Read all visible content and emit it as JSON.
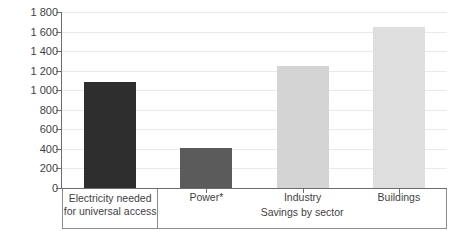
{
  "chart_data": {
    "type": "bar",
    "title": "",
    "xlabel": "Savings by sector",
    "ylabel": "TWh",
    "ylim": [
      0,
      1800
    ],
    "ytick_step": 200,
    "grid": true,
    "legend": "none",
    "categories": [
      "Electricity needed\nfor universal access",
      "Power*",
      "Industry",
      "Buildings"
    ],
    "values": [
      1080,
      410,
      1250,
      1650
    ],
    "ytick_labels": [
      "0",
      "200",
      "400",
      "600",
      "800",
      "1 000",
      "1 200",
      "1 400",
      "1 600",
      "1 800"
    ],
    "bar_colors": [
      "#2e2e2e",
      "#5b5b5b",
      "#d4d4d4",
      "#dedede"
    ],
    "groups": [
      {
        "label": "",
        "members": [
          "Electricity needed\nfor universal access"
        ]
      },
      {
        "label": "Savings by sector",
        "members": [
          "Power*",
          "Industry",
          "Buildings"
        ]
      }
    ],
    "footnote_marker": "*"
  },
  "axis": {
    "y_title": "TWh",
    "group_title": "Savings by sector"
  },
  "colors": {
    "gridline": "#e9e9e9",
    "axis": "#6d6d6d",
    "text": "#3f3f3f",
    "box_border": "#8c8c8c",
    "background": "#ffffff"
  }
}
